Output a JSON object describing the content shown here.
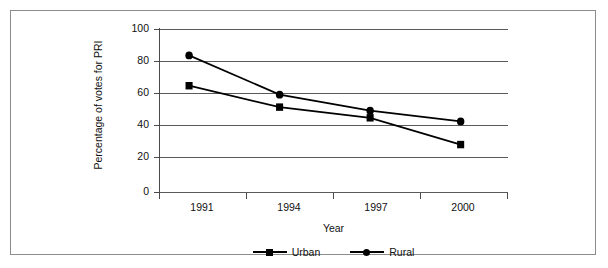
{
  "chart_data": {
    "type": "line",
    "title": "",
    "xlabel": "Year",
    "ylabel": "Percentage of votes for PRI",
    "categories": [
      "1991",
      "1994",
      "1997",
      "2000"
    ],
    "series": [
      {
        "name": "Urban",
        "marker": "square",
        "values": [
          63,
          51,
          45,
          30
        ]
      },
      {
        "name": "Rural",
        "marker": "circle",
        "values": [
          80,
          58,
          49,
          43
        ]
      }
    ],
    "ylim": [
      0,
      100
    ],
    "yticks": [
      0,
      20,
      40,
      60,
      80,
      100
    ],
    "ytick_labels": [
      "0",
      "20",
      "40",
      "60",
      "80",
      "100"
    ],
    "grid": "horizontal",
    "legend_position": "bottom",
    "line_color": "#000000",
    "grid_color": "#5a5a5a",
    "background": "#ffffff"
  },
  "axes": {
    "y_title": "Percentage of votes for PRI",
    "x_title": "Year"
  },
  "legend": {
    "entries": [
      {
        "label": "Urban",
        "marker": "square-marker"
      },
      {
        "label": "Rural",
        "marker": "circle-marker"
      }
    ]
  }
}
